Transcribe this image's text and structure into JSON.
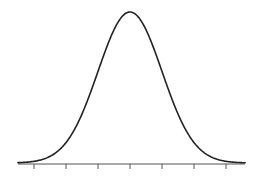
{
  "chart_data": {
    "type": "line",
    "title": "",
    "xlabel": "",
    "ylabel": "",
    "distribution": {
      "mean": 0,
      "sd": 1
    },
    "x_ticks": [
      -3,
      -2,
      -1,
      0,
      1,
      2,
      3
    ],
    "x_tick_labels": [
      "",
      "",
      "",
      "",
      "",
      "",
      ""
    ],
    "xlim": [
      -3.5,
      3.6
    ],
    "grid": false,
    "legend": null,
    "series": [
      {
        "name": "normal-density",
        "color": "#222222"
      }
    ],
    "axis_color": "#555555"
  },
  "layout": {
    "axis_y": 164,
    "axis_x_start": 18,
    "axis_x_end": 245,
    "center_x": 130,
    "px_per_sd": 32,
    "peak_y": 12,
    "tick_length": 5
  }
}
